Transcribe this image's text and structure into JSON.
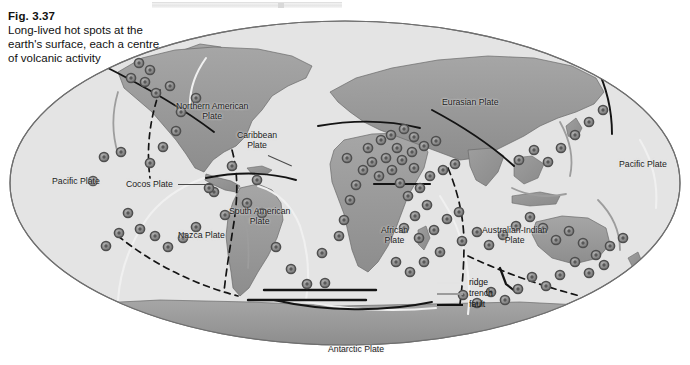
{
  "figure": {
    "number": "Fig. 3.37",
    "caption": "Long-lived hot spots at the earth's surface, each a centre of volcanic activity"
  },
  "legend": {
    "items": [
      {
        "label": "ridge",
        "color": "#e3e3e3",
        "style": "line-light"
      },
      {
        "label": "trench",
        "color": "#9c9c9c",
        "style": "line-mid"
      },
      {
        "label": "fault",
        "color": "#111111",
        "style": "line-dark"
      }
    ]
  },
  "map": {
    "projection": "ellipse",
    "ocean_color": "#e3e3e3",
    "land_color": "#9a9a9a",
    "outline_color": "#6a6a6a",
    "hotspot_color": "#8c8c8c",
    "hotspot_ring_color": "#4e4e4e",
    "background": "#ffffff",
    "plates": [
      {
        "name": "Pacific Plate",
        "x": 52,
        "y": 176,
        "align": "left"
      },
      {
        "name": "Cocos Plate",
        "x": 126,
        "y": 179,
        "align": "left"
      },
      {
        "name": "Northern American\nPlate",
        "x": 183,
        "y": 101,
        "align": "left"
      },
      {
        "name": "Caribbean\nPlate",
        "x": 239,
        "y": 133,
        "align": "left"
      },
      {
        "name": "Nazca Plate",
        "x": 178,
        "y": 230,
        "align": "left"
      },
      {
        "name": "South American\nPlate",
        "x": 235,
        "y": 208,
        "align": "left"
      },
      {
        "name": "African\nPlate",
        "x": 384,
        "y": 226,
        "align": "left"
      },
      {
        "name": "Eurasian Plate",
        "x": 443,
        "y": 97,
        "align": "left"
      },
      {
        "name": "Australian-Indian\nPlate",
        "x": 483,
        "y": 226,
        "align": "left"
      },
      {
        "name": "Pacific Plate",
        "x": 621,
        "y": 159,
        "align": "left"
      },
      {
        "name": "Antarctic Plate",
        "x": 329,
        "y": 345,
        "align": "left"
      }
    ],
    "hotspot_count": 104,
    "hotspots": [
      [
        139,
        63
      ],
      [
        150,
        70
      ],
      [
        131,
        78
      ],
      [
        145,
        82
      ],
      [
        156,
        93
      ],
      [
        170,
        86
      ],
      [
        196,
        98
      ],
      [
        181,
        112
      ],
      [
        176,
        131
      ],
      [
        163,
        147
      ],
      [
        150,
        163
      ],
      [
        121,
        152
      ],
      [
        104,
        157
      ],
      [
        93,
        181
      ],
      [
        128,
        213
      ],
      [
        140,
        229
      ],
      [
        155,
        236
      ],
      [
        168,
        247
      ],
      [
        183,
        238
      ],
      [
        196,
        227
      ],
      [
        119,
        233
      ],
      [
        106,
        246
      ],
      [
        225,
        215
      ],
      [
        247,
        203
      ],
      [
        262,
        213
      ],
      [
        257,
        180
      ],
      [
        232,
        166
      ],
      [
        214,
        192
      ],
      [
        209,
        188
      ],
      [
        276,
        247
      ],
      [
        291,
        269
      ],
      [
        307,
        284
      ],
      [
        325,
        283
      ],
      [
        322,
        253
      ],
      [
        339,
        236
      ],
      [
        344,
        220
      ],
      [
        350,
        200
      ],
      [
        356,
        185
      ],
      [
        363,
        170
      ],
      [
        347,
        158
      ],
      [
        368,
        148
      ],
      [
        381,
        140
      ],
      [
        391,
        135
      ],
      [
        404,
        129
      ],
      [
        414,
        137
      ],
      [
        397,
        148
      ],
      [
        386,
        158
      ],
      [
        372,
        162
      ],
      [
        379,
        176
      ],
      [
        392,
        170
      ],
      [
        402,
        160
      ],
      [
        412,
        152
      ],
      [
        424,
        146
      ],
      [
        436,
        141
      ],
      [
        414,
        168
      ],
      [
        400,
        183
      ],
      [
        408,
        196
      ],
      [
        420,
        188
      ],
      [
        430,
        176
      ],
      [
        443,
        170
      ],
      [
        455,
        164
      ],
      [
        427,
        205
      ],
      [
        415,
        216
      ],
      [
        404,
        228
      ],
      [
        419,
        238
      ],
      [
        434,
        230
      ],
      [
        447,
        219
      ],
      [
        459,
        212
      ],
      [
        396,
        262
      ],
      [
        410,
        272
      ],
      [
        424,
        262
      ],
      [
        440,
        252
      ],
      [
        462,
        241
      ],
      [
        477,
        232
      ],
      [
        489,
        245
      ],
      [
        503,
        235
      ],
      [
        516,
        226
      ],
      [
        530,
        217
      ],
      [
        543,
        228
      ],
      [
        556,
        240
      ],
      [
        569,
        231
      ],
      [
        583,
        243
      ],
      [
        596,
        255
      ],
      [
        610,
        246
      ],
      [
        623,
        238
      ],
      [
        575,
        262
      ],
      [
        589,
        273
      ],
      [
        604,
        265
      ],
      [
        560,
        275
      ],
      [
        546,
        286
      ],
      [
        532,
        277
      ],
      [
        518,
        289
      ],
      [
        505,
        300
      ],
      [
        491,
        292
      ],
      [
        477,
        303
      ],
      [
        463,
        295
      ],
      [
        519,
        160
      ],
      [
        534,
        150
      ],
      [
        548,
        162
      ],
      [
        561,
        148
      ],
      [
        575,
        135
      ],
      [
        589,
        122
      ],
      [
        603,
        110
      ]
    ]
  }
}
